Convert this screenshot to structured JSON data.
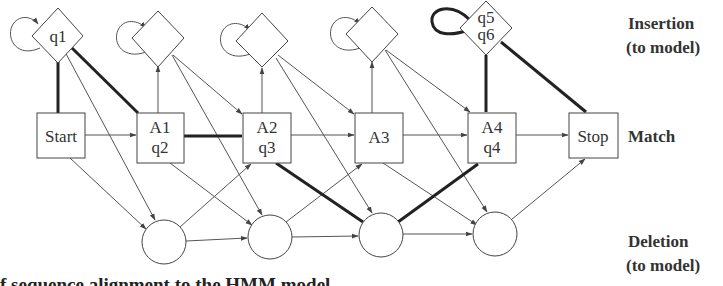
{
  "diagram": {
    "type": "profile-hmm",
    "row_labels": {
      "insertion": {
        "line1": "Insertion",
        "line2": "(to model)"
      },
      "match": {
        "line1": "Match"
      },
      "deletion": {
        "line1": "Deletion",
        "line2": "(to model)"
      }
    },
    "insertion_states": [
      {
        "id": "I0",
        "label_lines": [
          "q1"
        ],
        "bold_self_loop": false
      },
      {
        "id": "I1",
        "label_lines": [],
        "bold_self_loop": false
      },
      {
        "id": "I2",
        "label_lines": [],
        "bold_self_loop": false
      },
      {
        "id": "I3",
        "label_lines": [],
        "bold_self_loop": false
      },
      {
        "id": "I4",
        "label_lines": [
          "q5",
          "q6"
        ],
        "bold_self_loop": true
      }
    ],
    "match_states": [
      {
        "id": "Start",
        "label_lines": [
          "Start"
        ]
      },
      {
        "id": "M1",
        "label_lines": [
          "A1",
          "q2"
        ]
      },
      {
        "id": "M2",
        "label_lines": [
          "A2",
          "q3"
        ]
      },
      {
        "id": "M3",
        "label_lines": [
          "A3"
        ]
      },
      {
        "id": "M4",
        "label_lines": [
          "A4",
          "q4"
        ]
      },
      {
        "id": "Stop",
        "label_lines": [
          "Stop"
        ]
      }
    ],
    "deletion_states": [
      {
        "id": "D1"
      },
      {
        "id": "D2"
      },
      {
        "id": "D3"
      },
      {
        "id": "D4"
      }
    ],
    "highlighted_path": [
      "Start",
      "q1",
      "A1/q2",
      "A2/q3",
      "D3",
      "A4/q4",
      "q5",
      "q6",
      "Stop"
    ],
    "colors": {
      "line": "#444444",
      "bold_line": "#222222",
      "text": "#333333",
      "background": "#ffffff"
    }
  },
  "caption": "f sequence alignment to the HMM model"
}
